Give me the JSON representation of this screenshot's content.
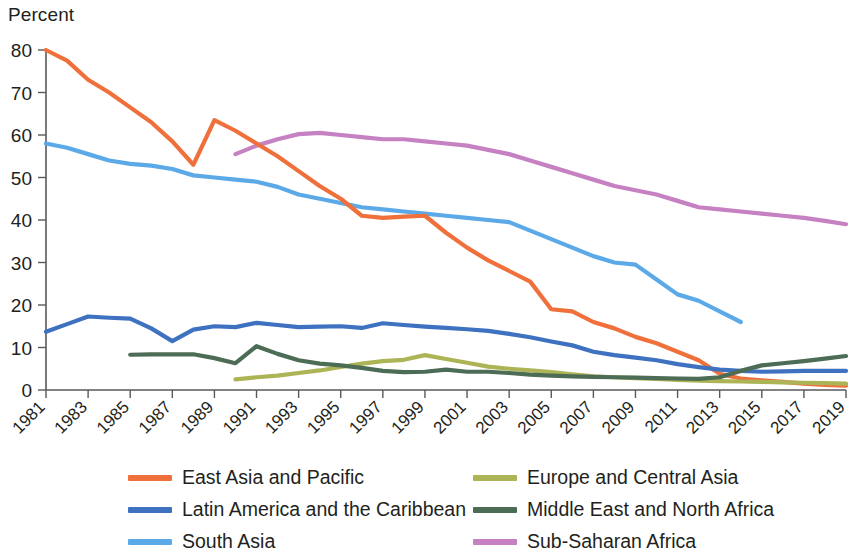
{
  "chart_data": {
    "type": "line",
    "title": "",
    "subtitle": "",
    "xlabel": "",
    "ylabel": "Percent",
    "ylim": [
      0,
      80
    ],
    "ytick_values": [
      0,
      10,
      20,
      30,
      40,
      50,
      60,
      70,
      80
    ],
    "ytick_labels": [
      "0",
      "10",
      "20",
      "30",
      "40",
      "50",
      "60",
      "70",
      "80"
    ],
    "xlim": [
      1981,
      2019
    ],
    "xtick_labels": [
      "1981",
      "1983",
      "1985",
      "1987",
      "1989",
      "1991",
      "1993",
      "1995",
      "1997",
      "1999",
      "2001",
      "2003",
      "2005",
      "2007",
      "2009",
      "2011",
      "2013",
      "2015",
      "2017",
      "2019"
    ],
    "xtick_values": [
      1981,
      1983,
      1985,
      1987,
      1989,
      1991,
      1993,
      1995,
      1997,
      1999,
      2001,
      2003,
      2005,
      2007,
      2009,
      2011,
      2013,
      2015,
      2017,
      2019
    ],
    "grid": false,
    "legend_position": "bottom",
    "legend_columns": 2,
    "series": [
      {
        "name": "East Asia and Pacific",
        "color": "#F0703C",
        "x": [
          1981,
          1982,
          1983,
          1984,
          1985,
          1986,
          1987,
          1988,
          1989,
          1990,
          1991,
          1992,
          1993,
          1994,
          1995,
          1996,
          1997,
          1998,
          1999,
          2000,
          2001,
          2002,
          2003,
          2004,
          2005,
          2006,
          2007,
          2008,
          2009,
          2010,
          2011,
          2012,
          2013,
          2014,
          2015,
          2016,
          2017,
          2018,
          2019
        ],
        "values": [
          80.0,
          77.5,
          73.0,
          70.0,
          66.5,
          63.0,
          58.5,
          53.0,
          63.5,
          61.0,
          58.0,
          55.0,
          51.5,
          48.0,
          45.0,
          41.0,
          40.5,
          40.8,
          41.0,
          37.0,
          33.5,
          30.5,
          28.0,
          25.5,
          19.0,
          18.5,
          16.0,
          14.5,
          12.5,
          11.0,
          9.0,
          7.0,
          3.8,
          2.7,
          2.3,
          1.9,
          1.5,
          1.2,
          1.0
        ]
      },
      {
        "name": "Latin America and the Caribbean",
        "color": "#3E72C0",
        "x": [
          1981,
          1982,
          1983,
          1984,
          1985,
          1986,
          1987,
          1988,
          1989,
          1990,
          1991,
          1992,
          1993,
          1994,
          1995,
          1996,
          1997,
          1998,
          1999,
          2000,
          2001,
          2002,
          2003,
          2004,
          2005,
          2006,
          2007,
          2008,
          2009,
          2010,
          2011,
          2012,
          2013,
          2014,
          2015,
          2016,
          2017,
          2018,
          2019
        ],
        "values": [
          13.7,
          15.5,
          17.3,
          17.0,
          16.8,
          14.5,
          11.5,
          14.2,
          15.0,
          14.8,
          15.8,
          15.3,
          14.8,
          14.9,
          15.0,
          14.6,
          15.7,
          15.3,
          14.9,
          14.6,
          14.3,
          13.9,
          13.2,
          12.4,
          11.4,
          10.5,
          9.0,
          8.2,
          7.6,
          7.0,
          6.1,
          5.4,
          4.8,
          4.5,
          4.3,
          4.4,
          4.5,
          4.5,
          4.5
        ]
      },
      {
        "name": "South Asia",
        "color": "#5CA9E8",
        "x": [
          1981,
          1982,
          1983,
          1984,
          1985,
          1986,
          1987,
          1988,
          1989,
          1990,
          1991,
          1992,
          1993,
          1994,
          1995,
          1996,
          1997,
          1998,
          1999,
          2000,
          2001,
          2002,
          2003,
          2004,
          2005,
          2006,
          2007,
          2008,
          2009,
          2010,
          2011,
          2012,
          2013,
          2014
        ],
        "values": [
          58.0,
          57.0,
          55.5,
          54.0,
          53.2,
          52.8,
          52.0,
          50.5,
          50.0,
          49.5,
          49.0,
          47.8,
          46.0,
          45.0,
          44.0,
          43.0,
          42.5,
          42.0,
          41.5,
          41.0,
          40.5,
          40.0,
          39.5,
          37.5,
          35.5,
          33.5,
          31.5,
          30.0,
          29.5,
          26.0,
          22.5,
          21.0,
          18.5,
          16.0
        ]
      },
      {
        "name": "Europe and Central Asia",
        "color": "#ADB456",
        "x": [
          1990,
          1991,
          1992,
          1993,
          1994,
          1995,
          1996,
          1997,
          1998,
          1999,
          2000,
          2001,
          2002,
          2003,
          2004,
          2005,
          2006,
          2007,
          2008,
          2009,
          2010,
          2011,
          2012,
          2013,
          2014,
          2015,
          2016,
          2017,
          2018,
          2019
        ],
        "values": [
          2.5,
          3.0,
          3.4,
          4.0,
          4.6,
          5.4,
          6.2,
          6.8,
          7.1,
          8.2,
          7.3,
          6.4,
          5.5,
          5.0,
          4.6,
          4.2,
          3.7,
          3.2,
          3.0,
          2.8,
          2.6,
          2.4,
          2.2,
          2.1,
          2.0,
          1.9,
          1.8,
          1.7,
          1.6,
          1.5
        ]
      },
      {
        "name": "Middle East and North Africa",
        "color": "#4C6C55",
        "x": [
          1985,
          1986,
          1987,
          1988,
          1989,
          1990,
          1991,
          1992,
          1993,
          1994,
          1995,
          1996,
          1997,
          1998,
          1999,
          2000,
          2001,
          2002,
          2003,
          2004,
          2005,
          2006,
          2007,
          2008,
          2009,
          2010,
          2011,
          2012,
          2013,
          2014,
          2015,
          2016,
          2017,
          2018,
          2019
        ],
        "values": [
          8.3,
          8.4,
          8.4,
          8.4,
          7.5,
          6.3,
          10.3,
          8.5,
          7.0,
          6.2,
          5.8,
          5.2,
          4.5,
          4.2,
          4.3,
          4.8,
          4.3,
          4.3,
          4.0,
          3.6,
          3.4,
          3.2,
          3.1,
          3.0,
          2.9,
          2.8,
          2.7,
          2.6,
          3.0,
          4.5,
          5.8,
          6.3,
          6.8,
          7.4,
          8.0
        ]
      },
      {
        "name": "Sub-Saharan Africa",
        "color": "#C581C2",
        "x": [
          1990,
          1991,
          1992,
          1993,
          1994,
          1995,
          1996,
          1997,
          1998,
          1999,
          2000,
          2001,
          2002,
          2003,
          2004,
          2005,
          2006,
          2007,
          2008,
          2009,
          2010,
          2011,
          2012,
          2013,
          2014,
          2015,
          2016,
          2017,
          2018,
          2019
        ],
        "values": [
          55.5,
          57.5,
          59.0,
          60.2,
          60.5,
          60.0,
          59.5,
          59.0,
          59.0,
          58.5,
          58.0,
          57.5,
          56.5,
          55.5,
          54.0,
          52.5,
          51.0,
          49.5,
          48.0,
          47.0,
          46.0,
          44.5,
          43.0,
          42.5,
          42.0,
          41.5,
          41.0,
          40.5,
          39.8,
          39.0
        ]
      }
    ]
  }
}
